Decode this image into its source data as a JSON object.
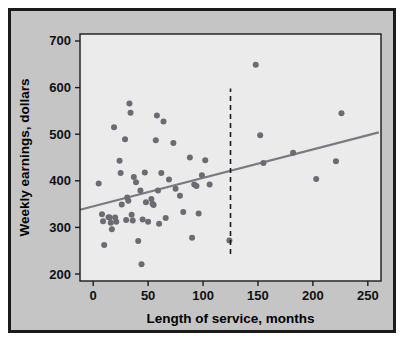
{
  "figure": {
    "background_color": "#c5c5c5",
    "border_color": "#1b1b1b",
    "plot_background_color": "#ebebeb",
    "frame_color": "#1b1b1b"
  },
  "chart_data": {
    "type": "scatter",
    "title": "",
    "xlabel": "Length of service, months",
    "ylabel": "Weekly earnings, dollars",
    "xlim": [
      -12,
      262
    ],
    "ylim": [
      185,
      715
    ],
    "xticks": [
      0,
      50,
      100,
      150,
      200,
      250
    ],
    "xtick_labels": [
      "0",
      "50",
      "100",
      "150",
      "200",
      "250"
    ],
    "yticks": [
      200,
      300,
      400,
      500,
      600,
      700
    ],
    "ytick_labels": [
      "200",
      "300",
      "400",
      "500",
      "600",
      "700"
    ],
    "grid": false,
    "legend": "none",
    "marker_color": "#6b6b73",
    "marker_size": 3.0,
    "points": [
      [
        5,
        394
      ],
      [
        8,
        328
      ],
      [
        9,
        313
      ],
      [
        10,
        262
      ],
      [
        14,
        322
      ],
      [
        15,
        321
      ],
      [
        16,
        310
      ],
      [
        17,
        296
      ],
      [
        19,
        515
      ],
      [
        20,
        321
      ],
      [
        21,
        312
      ],
      [
        24,
        443
      ],
      [
        25,
        417
      ],
      [
        26,
        349
      ],
      [
        29,
        489
      ],
      [
        30,
        316
      ],
      [
        31,
        364
      ],
      [
        32,
        357
      ],
      [
        33,
        566
      ],
      [
        34,
        546
      ],
      [
        35,
        327
      ],
      [
        36,
        315
      ],
      [
        37,
        408
      ],
      [
        39,
        397
      ],
      [
        41,
        271
      ],
      [
        43,
        379
      ],
      [
        44,
        221
      ],
      [
        45,
        317
      ],
      [
        47,
        418
      ],
      [
        48,
        354
      ],
      [
        50,
        312
      ],
      [
        53,
        361
      ],
      [
        54,
        351
      ],
      [
        55,
        348
      ],
      [
        57,
        487
      ],
      [
        58,
        540
      ],
      [
        59,
        379
      ],
      [
        60,
        308
      ],
      [
        62,
        417
      ],
      [
        64,
        527
      ],
      [
        66,
        320
      ],
      [
        69,
        403
      ],
      [
        73,
        481
      ],
      [
        75,
        383
      ],
      [
        79,
        368
      ],
      [
        82,
        333
      ],
      [
        88,
        450
      ],
      [
        90,
        278
      ],
      [
        92,
        392
      ],
      [
        94,
        389
      ],
      [
        96,
        330
      ],
      [
        99,
        412
      ],
      [
        102,
        444
      ],
      [
        106,
        392
      ],
      [
        124,
        272
      ],
      [
        148,
        649
      ],
      [
        152,
        498
      ],
      [
        155,
        438
      ],
      [
        182,
        460
      ],
      [
        203,
        404
      ],
      [
        221,
        442
      ],
      [
        226,
        545
      ]
    ],
    "trend_line": {
      "color": "#7a7a82",
      "x_start": -12,
      "y_start": 338,
      "x_end": 260,
      "y_end": 504,
      "width": 2.2
    },
    "reference_line": {
      "type": "vertical-dashed",
      "x": 125,
      "y_bottom": 243,
      "y_top": 598,
      "color": "#1b1b1b"
    }
  }
}
